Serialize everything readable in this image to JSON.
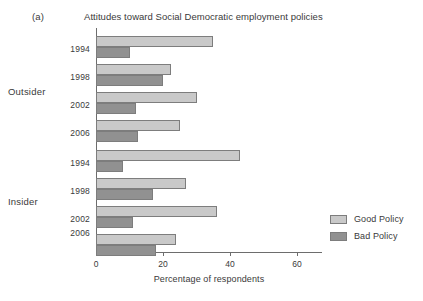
{
  "figure": {
    "panel_label": "(a)",
    "title": "Attitudes toward Social Democratic employment policies"
  },
  "legend": {
    "position": "right",
    "items": [
      {
        "label": "Good Policy",
        "color": "#c9c9c9",
        "name": "good-policy"
      },
      {
        "label": "Bad Policy",
        "color": "#919191",
        "name": "bad-policy"
      }
    ]
  },
  "axis": {
    "x_title": "Percentage of respondents",
    "x_ticks": [
      "0",
      "20",
      "40",
      "60"
    ],
    "x_tick_values": [
      0,
      20,
      40,
      60
    ]
  },
  "groups": [
    {
      "label": "Outsider",
      "years": [
        "1994",
        "1998",
        "2002",
        "2006"
      ]
    },
    {
      "label": "Insider",
      "years": [
        "1994",
        "1998",
        "2002",
        "2006"
      ]
    }
  ],
  "chart_data": {
    "type": "bar",
    "orientation": "horizontal",
    "title": "Attitudes toward Social Democratic employment policies",
    "panel": "(a)",
    "xlabel": "Percentage of respondents",
    "ylabel": "",
    "xlim": [
      0,
      65
    ],
    "grid": false,
    "legend_position": "right",
    "categories": [
      "Outsider 1994",
      "Outsider 1998",
      "Outsider 2002",
      "Outsider 2006",
      "Insider 1994",
      "Insider 1998",
      "Insider 2002",
      "Insider 2006"
    ],
    "series": [
      {
        "name": "Good Policy",
        "color": "#c9c9c9",
        "values": [
          35,
          22.5,
          30,
          25,
          43,
          27,
          36,
          24
        ]
      },
      {
        "name": "Bad Policy",
        "color": "#919191",
        "values": [
          10,
          20,
          12,
          12.5,
          8,
          17,
          11,
          18
        ]
      }
    ]
  }
}
